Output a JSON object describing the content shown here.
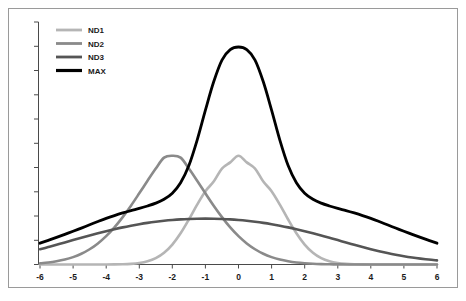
{
  "chart_data": {
    "type": "line",
    "title": "",
    "subtitle": "",
    "xlabel": "",
    "ylabel": "",
    "xlim": [
      -6,
      6
    ],
    "ylim": [
      0,
      1.06
    ],
    "grid": false,
    "legend_position": "top-left",
    "x_tick_labels": [
      "-6",
      "-5",
      "-4",
      "-3",
      "-2",
      "-1",
      "0",
      "1",
      "2",
      "3",
      "4",
      "5",
      "6"
    ],
    "x_ticks": [
      -6,
      -5,
      -4,
      -3,
      -2,
      -1,
      0,
      1,
      2,
      3,
      4,
      5,
      6
    ],
    "y_tick_labels": [],
    "y_tick_count": 11,
    "x": [
      -6,
      -5.75,
      -5.5,
      -5.25,
      -5,
      -4.75,
      -4.5,
      -4.25,
      -4,
      -3.75,
      -3.5,
      -3.25,
      -3,
      -2.75,
      -2.5,
      -2.25,
      -2,
      -1.75,
      -1.5,
      -1.25,
      -1,
      -0.75,
      -0.5,
      -0.25,
      0,
      0.25,
      0.5,
      0.75,
      1,
      1.25,
      1.5,
      1.75,
      2,
      2.25,
      2.5,
      2.75,
      3,
      3.25,
      3.5,
      3.75,
      4,
      4.25,
      4.5,
      4.75,
      5,
      5.25,
      5.5,
      5.75,
      6
    ],
    "series": [
      {
        "name": "ND1",
        "color": "#b5b5b5",
        "stroke_width": 2.6,
        "sigma": 1.0,
        "peak": 0.5,
        "values": [
          0.0,
          0.0,
          0.0,
          0.0,
          0.0,
          0.0,
          0.0,
          0.0,
          0.0002,
          0.0004,
          0.0011,
          0.0029,
          0.0067,
          0.0146,
          0.0292,
          0.0539,
          0.0916,
          0.1435,
          0.207,
          0.2752,
          0.3372,
          0.3812,
          0.4412,
          0.4695,
          0.5,
          0.4695,
          0.4412,
          0.3812,
          0.3372,
          0.2752,
          0.207,
          0.1435,
          0.0916,
          0.0539,
          0.0292,
          0.0146,
          0.0067,
          0.0029,
          0.0011,
          0.0004,
          0.0002,
          0.0,
          0.0,
          0.0,
          0.0,
          0.0,
          0.0,
          0.0,
          0.0
        ]
      },
      {
        "name": "ND2",
        "color": "#8a8a8a",
        "stroke_width": 2.6,
        "sigma": 2.0,
        "peak": 0.5,
        "values": [
          0.0055,
          0.009,
          0.0146,
          0.0225,
          0.0339,
          0.0494,
          0.0702,
          0.0969,
          0.1304,
          0.1707,
          0.2179,
          0.2705,
          0.3272,
          0.3851,
          0.4412,
          0.4913,
          0.5,
          0.4913,
          0.4412,
          0.3851,
          0.3272,
          0.2705,
          0.2179,
          0.1707,
          0.1304,
          0.0969,
          0.0702,
          0.0494,
          0.0339,
          0.0225,
          0.0146,
          0.009,
          0.0055,
          0.0032,
          0.0018,
          0.001,
          0.0006,
          0.0003,
          0.0002,
          0.0001,
          0.0,
          0.0,
          0.0,
          0.0,
          0.0,
          0.0,
          0.0,
          0.0,
          0.0
        ]
      },
      {
        "name": "ND3",
        "color": "#555555",
        "stroke_width": 2.6,
        "sigma": 4.0,
        "peak": 0.25,
        "values": [
          0.07,
          0.08,
          0.0906,
          0.1014,
          0.1122,
          0.123,
          0.1335,
          0.1436,
          0.1533,
          0.1623,
          0.1707,
          0.1783,
          0.1852,
          0.1913,
          0.1965,
          0.2009,
          0.2045,
          0.2073,
          0.2092,
          0.2103,
          0.2107,
          0.2103,
          0.2092,
          0.2073,
          0.2045,
          0.2009,
          0.1965,
          0.1913,
          0.1852,
          0.1783,
          0.1707,
          0.1623,
          0.1533,
          0.1436,
          0.1335,
          0.123,
          0.1122,
          0.1014,
          0.0906,
          0.08,
          0.07,
          0.0608,
          0.0524,
          0.0448,
          0.0381,
          0.0322,
          0.0271,
          0.0226,
          0.0188
        ]
      },
      {
        "name": "MAX",
        "color": "#000000",
        "stroke_width": 2.8,
        "peak": 1.0,
        "values": [
          0.098,
          0.111,
          0.1245,
          0.1385,
          0.153,
          0.1675,
          0.1825,
          0.1975,
          0.212,
          0.225,
          0.237,
          0.248,
          0.258,
          0.269,
          0.282,
          0.3,
          0.328,
          0.376,
          0.455,
          0.572,
          0.71,
          0.84,
          0.94,
          0.988,
          1.0,
          0.988,
          0.94,
          0.84,
          0.71,
          0.572,
          0.455,
          0.376,
          0.328,
          0.3,
          0.282,
          0.269,
          0.258,
          0.248,
          0.237,
          0.225,
          0.212,
          0.1975,
          0.1825,
          0.1675,
          0.153,
          0.1385,
          0.1245,
          0.111,
          0.098
        ]
      }
    ]
  },
  "legend": {
    "items": [
      {
        "label": "ND1",
        "color": "#b5b5b5"
      },
      {
        "label": "ND2",
        "color": "#8a8a8a"
      },
      {
        "label": "ND3",
        "color": "#555555"
      },
      {
        "label": "MAX",
        "color": "#000000"
      }
    ]
  }
}
